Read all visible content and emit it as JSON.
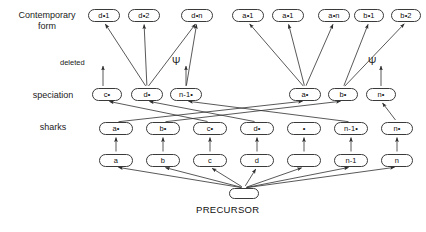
{
  "diagram": {
    "row_labels": [
      {
        "name": "contemporary-form",
        "text": "Contemporary\nform",
        "x": 8,
        "y": 10,
        "w": 78
      },
      {
        "name": "speciation",
        "text": "speciation",
        "x": 22,
        "y": 90,
        "w": 62
      },
      {
        "name": "sharks",
        "text": "sharks",
        "x": 30,
        "y": 122,
        "w": 46
      }
    ],
    "annotations": [
      {
        "name": "deleted-label",
        "text": "deleted",
        "x": 60,
        "y": 58
      },
      {
        "name": "psi-left",
        "text": "Ψ",
        "x": 172,
        "y": 57
      },
      {
        "name": "psi-right",
        "text": "Ψ",
        "x": 368,
        "y": 57
      }
    ],
    "caption": {
      "name": "precursor-caption",
      "text": "PRECURSOR",
      "x": 196,
      "y": 204
    },
    "rows": {
      "contemporary": [
        {
          "id": "d1",
          "label": "d•1",
          "x": 88,
          "y": 9,
          "w": 32,
          "h": 13
        },
        {
          "id": "d2",
          "label": "d•2",
          "x": 128,
          "y": 9,
          "w": 32,
          "h": 13
        },
        {
          "id": "dn",
          "label": "d•n",
          "x": 181,
          "y": 9,
          "w": 32,
          "h": 13
        },
        {
          "id": "a1",
          "label": "a•1",
          "x": 232,
          "y": 9,
          "w": 32,
          "h": 13
        },
        {
          "id": "a1b",
          "label": "a•1",
          "x": 272,
          "y": 9,
          "w": 32,
          "h": 13
        },
        {
          "id": "an",
          "label": "a•n",
          "x": 318,
          "y": 9,
          "w": 32,
          "h": 13
        },
        {
          "id": "b1",
          "label": "b•1",
          "x": 354,
          "y": 9,
          "w": 30,
          "h": 13
        },
        {
          "id": "b2",
          "label": "b•2",
          "x": 391,
          "y": 9,
          "w": 30,
          "h": 13
        }
      ],
      "speciation": [
        {
          "id": "cs",
          "label": "c•",
          "x": 92,
          "y": 88,
          "w": 30,
          "h": 13
        },
        {
          "id": "ds",
          "label": "d•",
          "x": 131,
          "y": 88,
          "w": 32,
          "h": 13
        },
        {
          "id": "n1s",
          "label": "n-1•",
          "x": 170,
          "y": 88,
          "w": 32,
          "h": 13
        },
        {
          "id": "as",
          "label": "a•",
          "x": 289,
          "y": 88,
          "w": 32,
          "h": 13
        },
        {
          "id": "bs",
          "label": "b•",
          "x": 328,
          "y": 88,
          "w": 30,
          "h": 13
        },
        {
          "id": "ns",
          "label": "n•",
          "x": 366,
          "y": 88,
          "w": 30,
          "h": 13
        }
      ],
      "sharks": [
        {
          "id": "ash",
          "label": "a•",
          "x": 99,
          "y": 122,
          "w": 34,
          "h": 13
        },
        {
          "id": "bsh",
          "label": "b•",
          "x": 146,
          "y": 122,
          "w": 34,
          "h": 13
        },
        {
          "id": "csh",
          "label": "c•",
          "x": 193,
          "y": 122,
          "w": 34,
          "h": 13
        },
        {
          "id": "dsh",
          "label": "d•",
          "x": 240,
          "y": 122,
          "w": 34,
          "h": 13
        },
        {
          "id": "esh",
          "label": "•",
          "x": 287,
          "y": 122,
          "w": 34,
          "h": 13
        },
        {
          "id": "n1sh",
          "label": "n-1•",
          "x": 334,
          "y": 122,
          "w": 34,
          "h": 13
        },
        {
          "id": "nsh",
          "label": "n•",
          "x": 381,
          "y": 122,
          "w": 32,
          "h": 13
        }
      ],
      "base": [
        {
          "id": "a",
          "label": "a",
          "x": 99,
          "y": 154,
          "w": 34,
          "h": 13
        },
        {
          "id": "b",
          "label": "b",
          "x": 146,
          "y": 154,
          "w": 34,
          "h": 13
        },
        {
          "id": "c",
          "label": "c",
          "x": 193,
          "y": 154,
          "w": 34,
          "h": 13
        },
        {
          "id": "d",
          "label": "d",
          "x": 240,
          "y": 154,
          "w": 34,
          "h": 13
        },
        {
          "id": "e",
          "label": "",
          "x": 287,
          "y": 154,
          "w": 34,
          "h": 13
        },
        {
          "id": "n1",
          "label": "n-1",
          "x": 334,
          "y": 154,
          "w": 34,
          "h": 13
        },
        {
          "id": "n",
          "label": "n",
          "x": 381,
          "y": 154,
          "w": 32,
          "h": 13
        }
      ],
      "precursor": [
        {
          "id": "precursor",
          "label": "",
          "x": 229,
          "y": 188,
          "w": 30,
          "h": 11
        }
      ]
    },
    "edges": [
      {
        "from": "ds",
        "to": "d1",
        "name": "edge-dstar-d1"
      },
      {
        "from": "ds",
        "to": "d2",
        "name": "edge-dstar-d2"
      },
      {
        "from": "ds",
        "to": "dn",
        "name": "edge-dstar-dn"
      },
      {
        "from": "n1s",
        "to": "dn",
        "name": "edge-n1star-dn"
      },
      {
        "from": "as",
        "to": "a1",
        "name": "edge-astar-a1"
      },
      {
        "from": "as",
        "to": "a1b",
        "name": "edge-astar-a1b"
      },
      {
        "from": "as",
        "to": "an",
        "name": "edge-astar-an"
      },
      {
        "from": "bs",
        "to": "b1",
        "name": "edge-bstar-b1"
      },
      {
        "from": "bs",
        "to": "b2",
        "name": "edge-bstar-b2"
      },
      {
        "from": "ash",
        "to": "as",
        "name": "edge-ash-astar"
      },
      {
        "from": "bsh",
        "to": "bs",
        "name": "edge-bsh-bstar"
      },
      {
        "from": "csh",
        "to": "cs",
        "name": "edge-csh-cstar"
      },
      {
        "from": "dsh",
        "to": "ds",
        "name": "edge-dsh-dstar"
      },
      {
        "from": "n1sh",
        "to": "n1s",
        "name": "edge-n1sh-n1star"
      },
      {
        "from": "nsh",
        "to": "ns",
        "name": "edge-nsh-nstar"
      },
      {
        "from": "a",
        "to": "ash",
        "name": "edge-a-ash"
      },
      {
        "from": "b",
        "to": "bsh",
        "name": "edge-b-bsh"
      },
      {
        "from": "c",
        "to": "csh",
        "name": "edge-c-csh"
      },
      {
        "from": "d",
        "to": "dsh",
        "name": "edge-d-dsh"
      },
      {
        "from": "e",
        "to": "esh",
        "name": "edge-e-esh"
      },
      {
        "from": "n1",
        "to": "n1sh",
        "name": "edge-n1-n1sh"
      },
      {
        "from": "n",
        "to": "nsh",
        "name": "edge-n-nsh"
      },
      {
        "from": "precursor",
        "to": "a",
        "name": "edge-precursor-a"
      },
      {
        "from": "precursor",
        "to": "b",
        "name": "edge-precursor-b"
      },
      {
        "from": "precursor",
        "to": "c",
        "name": "edge-precursor-c"
      },
      {
        "from": "precursor",
        "to": "d",
        "name": "edge-precursor-d"
      },
      {
        "from": "precursor",
        "to": "e",
        "name": "edge-precursor-e"
      },
      {
        "from": "precursor",
        "to": "n1",
        "name": "edge-precursor-n1"
      },
      {
        "from": "precursor",
        "to": "n",
        "name": "edge-precursor-n"
      }
    ],
    "marker_edges": [
      {
        "name": "edge-cstar-deleted",
        "x1": 103,
        "y1": 86,
        "x2": 103,
        "y2": 66
      },
      {
        "name": "edge-n1star-psi",
        "x1": 186,
        "y1": 86,
        "x2": 186,
        "y2": 66
      },
      {
        "name": "edge-nstar-psi",
        "x1": 381,
        "y1": 86,
        "x2": 381,
        "y2": 66
      }
    ],
    "style": {
      "line_color": "#2e2e2e",
      "box_border": "#3a3a3a",
      "background": "#ffffff"
    }
  }
}
